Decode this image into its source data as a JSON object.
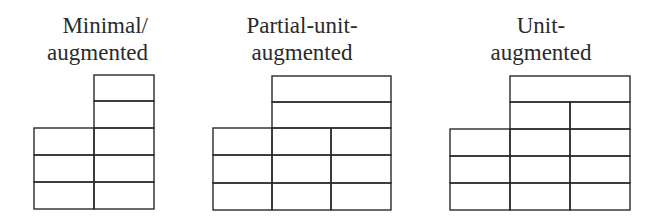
{
  "diagrams": [
    {
      "id": "minimal-augmented",
      "title_lines": [
        "Minimal/",
        "augmented"
      ],
      "title_align": "right",
      "base_columns": 2,
      "base_rows": 3,
      "upper_rows": [
        {
          "columns": 1,
          "spans_base_columns": [
            1,
            1
          ]
        },
        {
          "columns": 1,
          "spans_base_columns": [
            1,
            1
          ]
        }
      ]
    },
    {
      "id": "partial-unit-augmented",
      "title_lines": [
        "Partial-unit-",
        "augmented"
      ],
      "title_align": "center",
      "base_columns": 3,
      "base_rows": 3,
      "upper_rows": [
        {
          "columns": 1,
          "spans_base_columns": [
            1,
            2
          ]
        },
        {
          "columns": 1,
          "spans_base_columns": [
            1,
            2
          ]
        }
      ]
    },
    {
      "id": "unit-augmented",
      "title_lines": [
        "Unit-",
        "augmented"
      ],
      "title_align": "center",
      "base_columns": 3,
      "base_rows": 3,
      "upper_rows": [
        {
          "columns": 2,
          "spans_base_columns": [
            1,
            2
          ]
        },
        {
          "columns": 1,
          "spans_base_columns": [
            1,
            2
          ]
        }
      ]
    }
  ],
  "colors": {
    "line": "#2a2a2a",
    "text": "#2a2a2a",
    "background": "#ffffff"
  }
}
